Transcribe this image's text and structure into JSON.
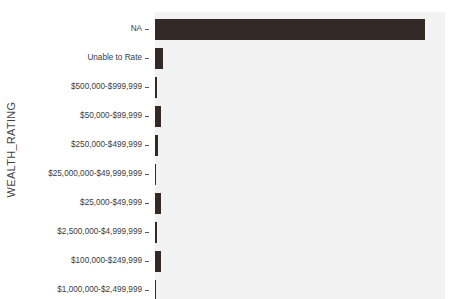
{
  "chart_data": {
    "type": "bar",
    "orientation": "horizontal",
    "title": "",
    "xlabel": "",
    "ylabel": "WEALTH_RATING",
    "grid": false,
    "legend": false,
    "axis_title_y": "WEALTH_RATING",
    "categories": [
      "NA",
      "Unable to Rate",
      "$500,000-$999,999",
      "$50,000-$99,999",
      "$250,000-$499,999",
      "$25,000,000-$49,999,999",
      "$25,000-$49,999",
      "$2,500,000-$4,999,999",
      "$100,000-$249,999",
      "$1,000,000-$2,499,999"
    ],
    "values": [
      270,
      8,
      2,
      6,
      3,
      1,
      6,
      2,
      6,
      1
    ],
    "value_unit": "count",
    "xlim": [
      0,
      290
    ],
    "bar_color": "#332a28",
    "panel_color": "#f2f2f2",
    "page_background": "#ffffff",
    "note": "Bottom of plot is cropped; no x-axis tick labels are visible in the screenshot."
  },
  "axis": {
    "y_title": "WEALTH_RATING"
  },
  "ticks": [
    {
      "label": "NA"
    },
    {
      "label": "Unable to Rate"
    },
    {
      "label": "$500,000-$999,999"
    },
    {
      "label": "$50,000-$99,999"
    },
    {
      "label": "$250,000-$499,999"
    },
    {
      "label": "$25,000,000-$49,999,999"
    },
    {
      "label": "$25,000-$49,999"
    },
    {
      "label": "$2,500,000-$4,999,999"
    },
    {
      "label": "$100,000-$249,999"
    },
    {
      "label": "$1,000,000-$2,499,999"
    }
  ]
}
